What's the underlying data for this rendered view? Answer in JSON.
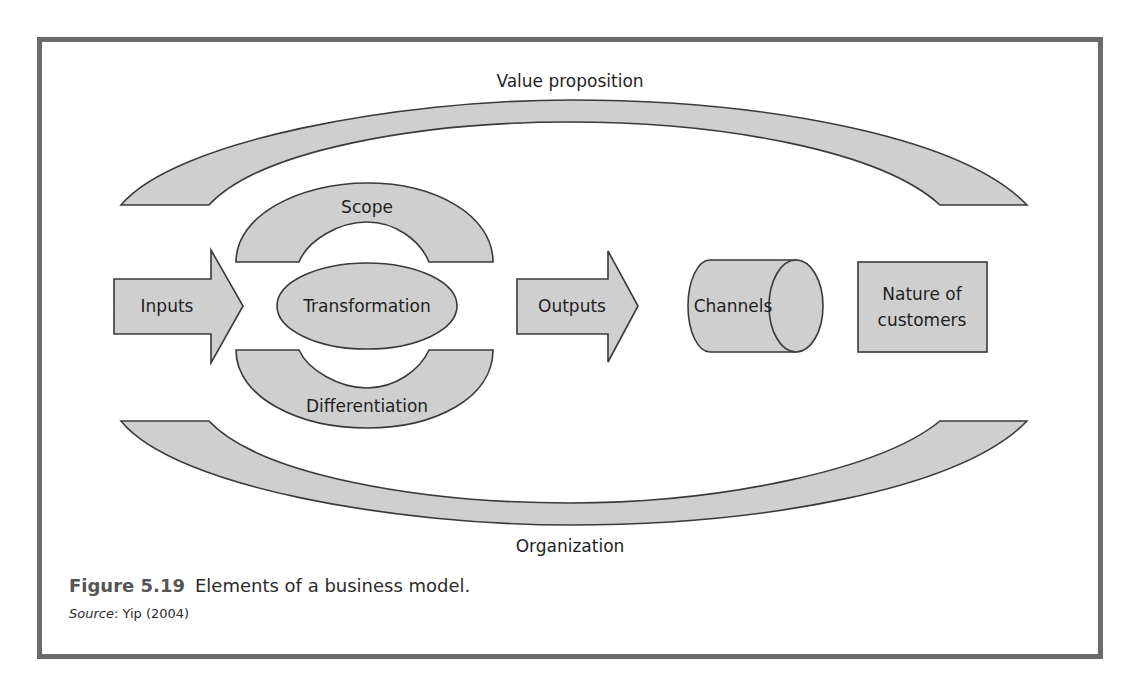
{
  "diagram": {
    "labels": {
      "value_proposition": "Value proposition",
      "organization": "Organization",
      "scope": "Scope",
      "transformation": "Transformation",
      "differentiation": "Differentiation",
      "inputs": "Inputs",
      "outputs": "Outputs",
      "channels": "Channels",
      "nature_line1": "Nature of",
      "nature_line2": "customers"
    },
    "fill_color": "#cfcfcf",
    "stroke_color": "#3a3a3a",
    "frame_color": "#6b6b6b"
  },
  "caption": {
    "figure_number": "Figure 5.19",
    "title": "Elements of a business model.",
    "source_label": "Source",
    "source_text": ": Yip (2004)"
  }
}
